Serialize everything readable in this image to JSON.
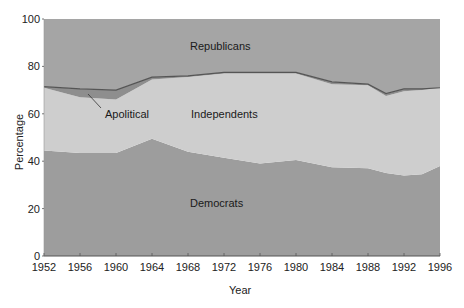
{
  "chart_data": {
    "type": "area",
    "title": "",
    "xlabel": "Year",
    "ylabel": "Percentage",
    "xlim": [
      1952,
      1996
    ],
    "ylim": [
      0,
      100
    ],
    "stacked": true,
    "grid": false,
    "x_ticks": [
      1952,
      1956,
      1960,
      1964,
      1968,
      1972,
      1976,
      1980,
      1984,
      1988,
      1992,
      1996
    ],
    "y_ticks": [
      0,
      20,
      40,
      60,
      80,
      100
    ],
    "x": [
      1952,
      1956,
      1960,
      1964,
      1968,
      1972,
      1976,
      1980,
      1984,
      1988,
      1990,
      1992,
      1994,
      1996
    ],
    "boundaries": {
      "democrats_top": [
        44.5,
        43.5,
        43.5,
        49.5,
        44,
        41.5,
        39,
        40.5,
        37.5,
        37,
        35,
        34,
        34.5,
        38
      ],
      "independents_top": [
        71,
        67,
        66,
        74.5,
        75.5,
        77,
        77,
        77,
        72.5,
        72,
        67.5,
        69.5,
        70,
        71
      ],
      "apolitical_top": [
        71.5,
        70.5,
        70,
        75.5,
        76,
        77.5,
        77.5,
        77.5,
        73.5,
        72.5,
        68.5,
        70.5,
        70.5,
        71
      ]
    },
    "series": [
      {
        "name": "Democrats",
        "color": "#9d9d9d",
        "values": [
          44.5,
          43.5,
          43.5,
          49.5,
          44,
          41.5,
          39,
          40.5,
          37.5,
          37,
          35,
          34,
          34.5,
          38
        ]
      },
      {
        "name": "Independents",
        "color": "#cecece",
        "values": [
          26.5,
          23.5,
          22.5,
          25,
          31.5,
          35.5,
          38,
          36.5,
          35,
          35,
          32.5,
          35.5,
          35.5,
          33
        ]
      },
      {
        "name": "Apolitical",
        "color": "#8e8e8e",
        "values": [
          0.5,
          3.5,
          4,
          1,
          0.5,
          0.5,
          0.5,
          0.5,
          1,
          0.5,
          1,
          1,
          0.5,
          0
        ]
      },
      {
        "name": "Republicans",
        "color": "#a5a5a5",
        "values": [
          28.5,
          29.5,
          30,
          24.5,
          24,
          22.5,
          22.5,
          22.5,
          26.5,
          27.5,
          31.5,
          29.5,
          29.5,
          29
        ]
      }
    ],
    "annotations": [
      {
        "text": "Republicans",
        "x": 1968,
        "y": 89
      },
      {
        "text": "Independents",
        "x": 1968,
        "y": 59
      },
      {
        "text": "Apolitical",
        "x": 1957,
        "y": 59,
        "leader_to": [
          1955,
          69
        ]
      },
      {
        "text": "Democrats",
        "x": 1968,
        "y": 21
      }
    ]
  },
  "labels": {
    "xlabel": "Year",
    "ylabel": "Percentage",
    "republicans": "Republicans",
    "independents": "Independents",
    "apolitical": "Apolitical",
    "democrats": "Democrats"
  }
}
